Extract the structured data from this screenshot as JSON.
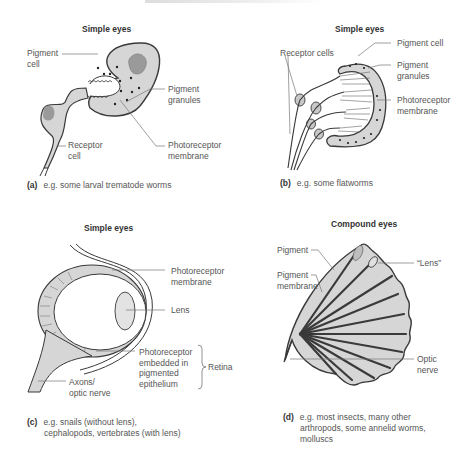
{
  "panels": [
    {
      "id": "a",
      "title": "Simple eyes",
      "labels": {
        "pigment_cell": [
          "Pigment",
          "cell"
        ],
        "pigment_granules": [
          "Pigment",
          "granules"
        ],
        "receptor_cell": [
          "Receptor",
          "cell"
        ],
        "photoreceptor_membrane": [
          "Photoreceptor",
          "membrane"
        ]
      },
      "caption_letter": "(a)",
      "caption": [
        "e.g. some larval trematode worms"
      ]
    },
    {
      "id": "b",
      "title": "Simple eyes",
      "labels": {
        "receptor_cells": [
          "Receptor cells"
        ],
        "pigment_cell": [
          "Pigment cell"
        ],
        "pigment_granules": [
          "Pigment",
          "granules"
        ],
        "photoreceptor_membrane": [
          "Photoreceptor",
          "membrane"
        ]
      },
      "caption_letter": "(b)",
      "caption": [
        "e.g. some flatworms"
      ]
    },
    {
      "id": "c",
      "title": "Simple eyes",
      "labels": {
        "photoreceptor_membrane": [
          "Photoreceptor",
          "membrane"
        ],
        "lens": [
          "Lens"
        ],
        "photoreceptor_embedded": [
          "Photoreceptor",
          "embedded in",
          "pigmented",
          "epithelium"
        ],
        "retina": [
          "Retina"
        ],
        "axons": [
          "Axons/",
          "optic nerve"
        ]
      },
      "caption_letter": "(c)",
      "caption": [
        "e.g. snails (without lens),",
        "cephalopods, vertebrates (with lens)"
      ]
    },
    {
      "id": "d",
      "title": "Compound eyes",
      "labels": {
        "pigment": [
          "Pigment"
        ],
        "pigment_membrane": [
          "Pigment",
          "membrane"
        ],
        "lens": [
          "“Lens”"
        ],
        "optic_nerve": [
          "Optic",
          "nerve"
        ]
      },
      "caption_letter": "(d)",
      "caption": [
        "e.g. most insects, many other",
        "arthropods, some annelid worms,",
        "molluscs"
      ]
    }
  ],
  "colors": {
    "fill": "#d6d6d6",
    "stroke": "#3a3a3a",
    "leader": "#777777",
    "text": "#555555"
  }
}
